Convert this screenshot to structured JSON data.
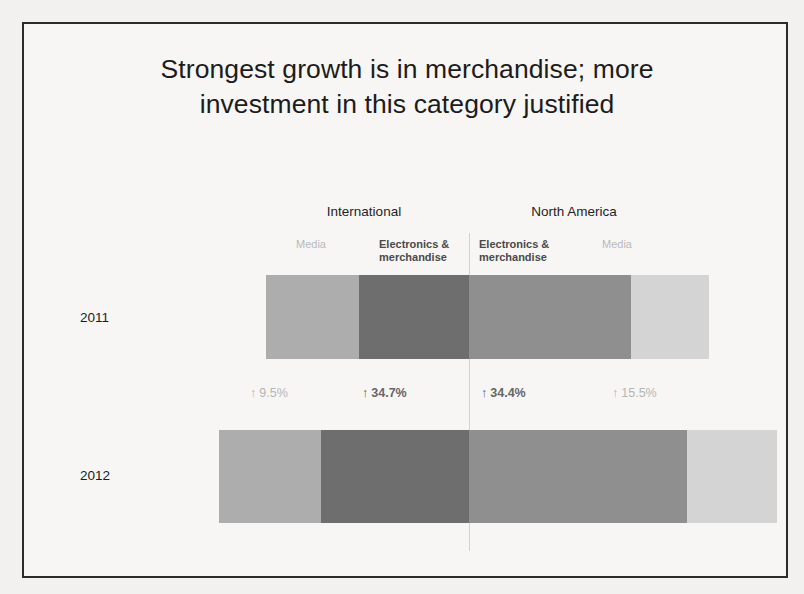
{
  "slide": {
    "title_line1": "Strongest growth is in merchandise; more",
    "title_line2": "investment in this category justified"
  },
  "regions": [
    {
      "name": "international",
      "label": "International"
    },
    {
      "name": "north-america",
      "label": "North America"
    }
  ],
  "category_labels": {
    "intl_media": "Media",
    "intl_merch": "Electronics &\nmerchandise",
    "na_merch": "Electronics &\nmerchandise",
    "na_media": "Media"
  },
  "years": {
    "y2011": "2011",
    "y2012": "2012"
  },
  "growth": {
    "arrow": "↑",
    "intl_media": "9.5%",
    "intl_merch": "34.7%",
    "na_merch": "34.4%",
    "na_media": "15.5%"
  },
  "colors": {
    "intl_media": "#adadad",
    "intl_merch": "#6e6e6e",
    "na_merch": "#8f8f8f",
    "na_media": "#d4d4d4",
    "divider": "#d2d2d2",
    "frame": "#2b2b2b",
    "background": "#f7f6f4",
    "title_text": "#1c1c1c",
    "muted_text": "#b9b9b9",
    "strong_text": "#4a4a4a"
  },
  "chart_data": {
    "type": "bar",
    "title": "Strongest growth is in merchandise; more investment in this category justified",
    "orientation": "horizontal",
    "layout": "diverging-stacked-from-center",
    "categories": [
      "2011",
      "2012"
    ],
    "xlabel": "",
    "ylabel": "",
    "grid": false,
    "legend": "inline-column-headers",
    "center_axis_label": "",
    "groups": [
      {
        "region": "International",
        "side": "left",
        "segments": [
          {
            "name": "Media",
            "emphasis": "muted",
            "color": "#adadad",
            "growth_pct": 9.5,
            "growth_direction": "up",
            "values": {
              "2011": 93,
              "2012": 102
            }
          },
          {
            "name": "Electronics & merchandise",
            "emphasis": "strong",
            "color": "#6e6e6e",
            "growth_pct": 34.7,
            "growth_direction": "up",
            "values": {
              "2011": 110,
              "2012": 148
            }
          }
        ]
      },
      {
        "region": "North America",
        "side": "right",
        "segments": [
          {
            "name": "Electronics & merchandise",
            "emphasis": "strong",
            "color": "#8f8f8f",
            "growth_pct": 34.4,
            "growth_direction": "up",
            "values": {
              "2011": 162,
              "2012": 218
            }
          },
          {
            "name": "Media",
            "emphasis": "muted",
            "color": "#d4d4d4",
            "growth_pct": 15.5,
            "growth_direction": "up",
            "values": {
              "2011": 78,
              "2012": 90
            }
          }
        ]
      }
    ]
  }
}
